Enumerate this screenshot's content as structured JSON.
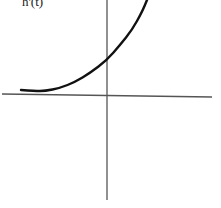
{
  "chart_data": {
    "type": "line",
    "title": "",
    "ylabel": "h'(t)",
    "xlabel": "",
    "grid": false,
    "legend": null,
    "axes": {
      "x_axis": {
        "x1": 2,
        "y1": 94,
        "x2": 212,
        "y2": 97
      },
      "y_axis": {
        "x1": 107,
        "y1": 0,
        "x2": 107,
        "y2": 200
      }
    },
    "series": [
      {
        "name": "curve",
        "description": "increasing convex curve, nearly flat on the left, slight dip then rising steeply to the right",
        "pixel_points": [
          [
            21,
            90
          ],
          [
            35,
            91
          ],
          [
            45,
            91
          ],
          [
            60,
            88
          ],
          [
            75,
            82
          ],
          [
            90,
            73
          ],
          [
            107,
            60
          ],
          [
            120,
            45
          ],
          [
            132,
            30
          ],
          [
            142,
            12
          ],
          [
            147,
            0
          ]
        ]
      }
    ],
    "colors": {
      "axis": "#555555",
      "curve": "#111111"
    }
  }
}
